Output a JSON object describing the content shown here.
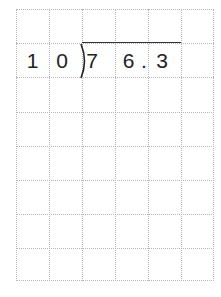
{
  "worksheet": {
    "divisor": [
      "1",
      "0"
    ],
    "dividend": [
      "7",
      "6",
      ".",
      "3"
    ],
    "grid": {
      "columns": 6,
      "rows": 8
    }
  }
}
